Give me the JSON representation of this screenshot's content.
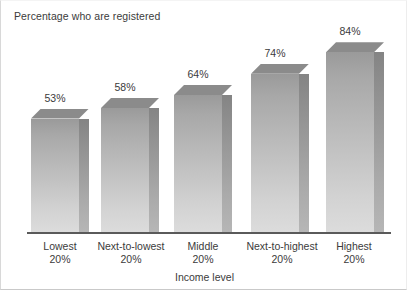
{
  "chart_data": {
    "type": "bar",
    "title": "Percentage who are registered",
    "xlabel": "Income level",
    "ylabel": "",
    "ylim": [
      0,
      100
    ],
    "grid": false,
    "legend": "none",
    "style": "3d-bar",
    "categories": [
      "Lowest 20%",
      "Next-to-lowest 20%",
      "Middle 20%",
      "Next-to-highest 20%",
      "Highest 20%"
    ],
    "category_lines": [
      [
        "Lowest",
        "20%"
      ],
      [
        "Next-to-lowest",
        "20%"
      ],
      [
        "Middle",
        "20%"
      ],
      [
        "Next-to-highest",
        "20%"
      ],
      [
        "Highest",
        "20%"
      ]
    ],
    "values": [
      53,
      58,
      64,
      74,
      84
    ],
    "data_labels": [
      "53%",
      "58%",
      "64%",
      "74%",
      "84%"
    ],
    "colors": {
      "bar_face_top": "#9a9a9a",
      "bar_face_bottom": "#dcdcdc",
      "bar_side": "#9c9c9c",
      "bar_top": "#8b8b8b",
      "axis_line": "#5a5a5a",
      "text": "#3b3b3b",
      "background": "#ffffff"
    }
  }
}
